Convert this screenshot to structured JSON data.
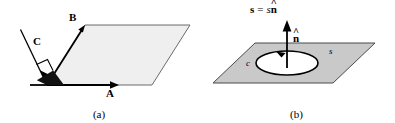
{
  "figure": {
    "panels": [
      {
        "id": "a",
        "caption": "(a)",
        "description": "parallelogram with vectors A, B and C with right angle marker",
        "surface_fill": "#efefef",
        "surface_stroke": "#6b6b6b",
        "vector_color": "#000000",
        "labels": [
          {
            "name": "vector-a",
            "text": "A",
            "style": "bold"
          },
          {
            "name": "vector-b",
            "text": "B",
            "style": "bold"
          },
          {
            "name": "vector-c",
            "text": "C",
            "style": "bold"
          }
        ]
      },
      {
        "id": "b",
        "caption": "(b)",
        "description": "open surface s bounded by closed curve c with unit normal n-hat",
        "surface_fill": "#c9c9c9",
        "surface_stroke": "#4a4a4a",
        "loop_fill": "#ffffff",
        "vector_color": "#000000",
        "equation": {
          "lhs": "s",
          "eq": "=",
          "rhs_scalar": "s",
          "rhs_unit": "n",
          "hat": "^"
        },
        "labels": [
          {
            "name": "surface-s",
            "text": "s",
            "style": "italic"
          },
          {
            "name": "curve-c",
            "text": "c",
            "style": "italic"
          },
          {
            "name": "normal-n-hat",
            "text": "n",
            "hat": "^",
            "style": "bold"
          }
        ]
      }
    ]
  }
}
